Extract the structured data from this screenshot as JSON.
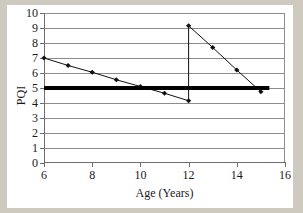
{
  "chart_data": {
    "type": "line",
    "title": "",
    "xlabel": "Age (Years)",
    "ylabel": "PQI",
    "xlim": [
      6,
      16
    ],
    "ylim": [
      0,
      10
    ],
    "xticks": [
      6,
      8,
      10,
      12,
      14,
      16
    ],
    "yticks": [
      0,
      1,
      2,
      3,
      4,
      5,
      6,
      7,
      8,
      9,
      10
    ],
    "grid": "horizontal",
    "legend": "none",
    "series": [
      {
        "name": "PQI deterioration curve",
        "marker": "diamond",
        "color": "#111111",
        "points": [
          {
            "x": 6,
            "y": 7.0
          },
          {
            "x": 7,
            "y": 6.5
          },
          {
            "x": 8,
            "y": 6.05
          },
          {
            "x": 9,
            "y": 5.55
          },
          {
            "x": 10,
            "y": 5.1
          },
          {
            "x": 11,
            "y": 4.65
          },
          {
            "x": 12,
            "y": 4.15
          },
          {
            "x": 12,
            "y": 9.15
          },
          {
            "x": 13,
            "y": 7.7
          },
          {
            "x": 14,
            "y": 6.2
          },
          {
            "x": 15,
            "y": 4.75
          }
        ]
      }
    ],
    "annotations": [
      {
        "name": "threshold-line",
        "label": "PQI threshold",
        "type": "horizontal-line",
        "y": 5.0,
        "x_start": 6.0,
        "x_end": 15.35,
        "color": "#000000",
        "width_px": 4
      },
      {
        "name": "rehabilitation-jump",
        "label": "Vertical rehabilitation jump at age 12",
        "type": "vertical-segment",
        "x": 12,
        "y_start": 4.15,
        "y_end": 9.15
      }
    ],
    "colors": {
      "background": "#ffffff",
      "outer_background": "#cfcabf",
      "gridline": "#8c8c8c",
      "axis": "#6e6e6e",
      "data": "#111111",
      "threshold": "#000000"
    },
    "xtick_labels": [
      "6",
      "8",
      "10",
      "12",
      "14",
      "16"
    ],
    "ytick_labels": [
      "0",
      "1",
      "2",
      "3",
      "4",
      "5",
      "6",
      "7",
      "8",
      "9",
      "10"
    ]
  }
}
